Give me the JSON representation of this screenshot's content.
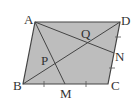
{
  "diagram": {
    "type": "geometry",
    "shape": "parallelogram",
    "fill_color": "#bdbdbd",
    "line_color": "#444444",
    "points": {
      "A": {
        "label": "A",
        "x": 35,
        "y": 22
      },
      "B": {
        "label": "B",
        "x": 23,
        "y": 84
      },
      "C": {
        "label": "C",
        "x": 108,
        "y": 84
      },
      "D": {
        "label": "D",
        "x": 120,
        "y": 22
      },
      "M": {
        "label": "M",
        "x": 65,
        "y": 84
      },
      "N": {
        "label": "N",
        "x": 114,
        "y": 53
      },
      "P": {
        "label": "P",
        "x": 48,
        "y": 62
      },
      "Q": {
        "label": "Q",
        "x": 86,
        "y": 41
      }
    },
    "segments": [
      "AB",
      "BC",
      "CD",
      "DA",
      "BD",
      "AM",
      "AN"
    ],
    "equal_marks": [
      "BM",
      "MC",
      "DN",
      "NC"
    ]
  }
}
